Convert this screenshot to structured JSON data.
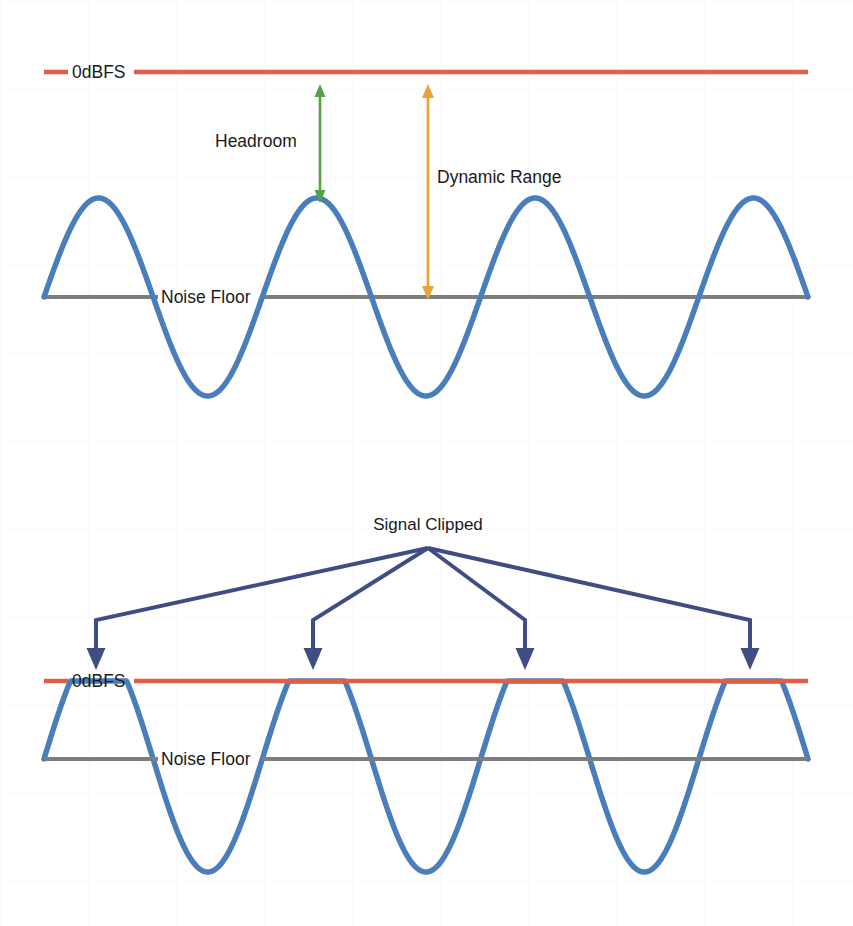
{
  "diagram": {
    "title_hidden": "",
    "colors": {
      "background": "#ffffff",
      "grid": "#f2f2f4",
      "zero_dbfs_line": "#dd5e49",
      "noise_floor_line": "#7d7d7d",
      "waveform": "#4a7ebb",
      "headroom_arrow": "#56a04a",
      "dynamic_range_arrow": "#e8a33d",
      "callout_arrow": "#404d84",
      "text": "#1a1a1a"
    },
    "panels": [
      {
        "id": "unclipped",
        "name": "normal-signal-panel",
        "labels": {
          "zero_dbfs": "0dBFS",
          "noise_floor": "Noise Floor",
          "headroom": "Headroom",
          "dynamic_range": "Dynamic Range"
        },
        "levels": {
          "zero_dbfs_y": 72,
          "noise_floor_y": 297,
          "peak_y": 200,
          "trough_y": 400
        },
        "waveform": {
          "type": "sine",
          "clipped": false,
          "x_start": 44,
          "x_end": 808,
          "cycles": 3.5,
          "amplitude": 99,
          "midline_y": 297
        },
        "measures": [
          {
            "name": "headroom",
            "label": "Headroom",
            "color": "#56a04a",
            "x": 320,
            "y_top": 86,
            "y_bottom": 200,
            "double_headed": true
          },
          {
            "name": "dynamic-range",
            "label": "Dynamic Range",
            "color": "#e8a33d",
            "x": 428,
            "y_top": 86,
            "y_bottom": 297,
            "double_headed": true
          }
        ]
      },
      {
        "id": "clipped",
        "name": "clipped-signal-panel",
        "labels": {
          "zero_dbfs": "0dBFS",
          "noise_floor": "Noise Floor",
          "callout": "Signal Clipped"
        },
        "levels": {
          "zero_dbfs_y": 681,
          "noise_floor_y": 759,
          "clip_y": 681,
          "trough_y": 872
        },
        "waveform": {
          "type": "sine",
          "clipped": true,
          "x_start": 44,
          "x_end": 808,
          "cycles": 3.5,
          "amplitude": 113,
          "midline_y": 759,
          "clip_level_y": 681
        },
        "callout": {
          "text": "Signal Clipped",
          "apex_x": 428,
          "apex_y": 548,
          "text_x": 428,
          "text_y": 524,
          "color": "#404d84",
          "arrow_targets": [
            96,
            313,
            525,
            750
          ],
          "arrow_tip_y": 670,
          "arrow_bend_y": 620
        }
      }
    ]
  }
}
